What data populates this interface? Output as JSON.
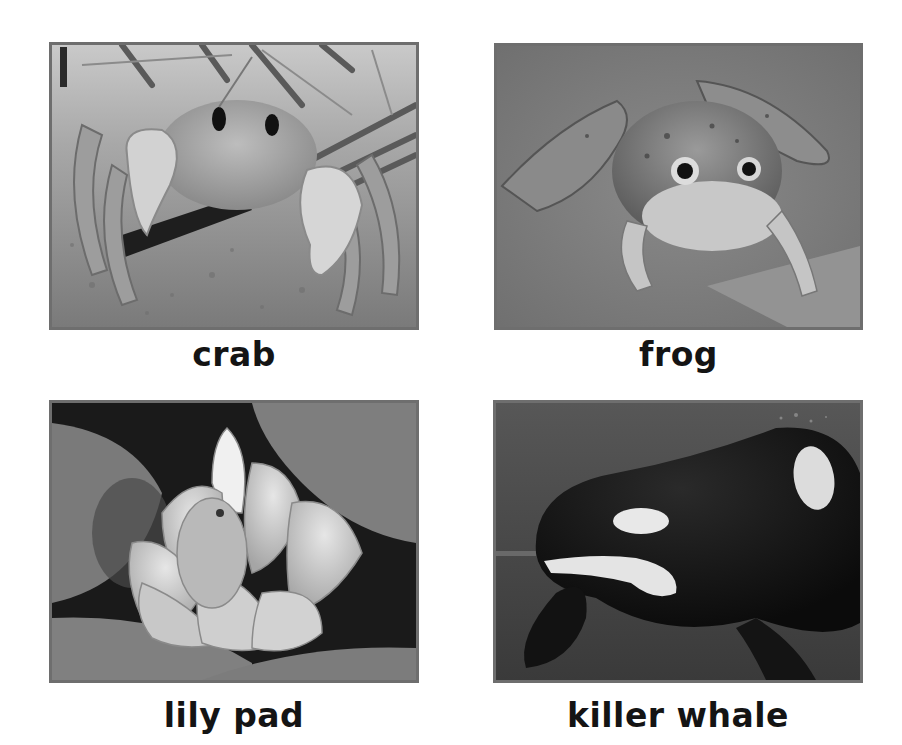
{
  "cards": [
    {
      "label": "crab",
      "image": "crab-photo",
      "description": "Grayscale photo of a ghost crab on sand among dry grass blades"
    },
    {
      "label": "frog",
      "image": "frog-photo",
      "description": "Grayscale photo of a bullfrog sitting on a gray surface"
    },
    {
      "label": "lily pad",
      "image": "lily-pad-photo",
      "description": "Grayscale photo of a water lily flower among lily pads"
    },
    {
      "label": "killer whale",
      "image": "killer-whale-photo",
      "description": "Grayscale photo of an orca swimming underwater"
    }
  ],
  "colors": {
    "frame_border": "#6e6e6e",
    "label_text": "#141414",
    "background": "#ffffff"
  }
}
